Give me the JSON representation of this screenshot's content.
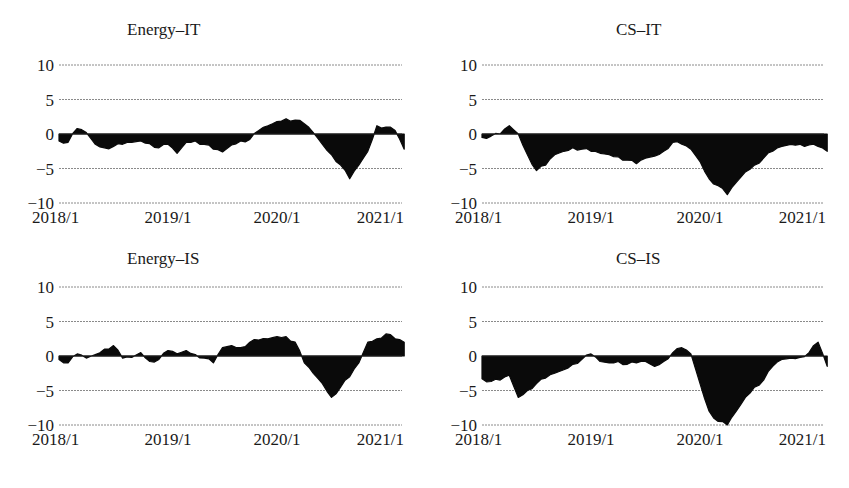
{
  "figure": {
    "y_ticks": [
      10,
      5,
      0,
      -5,
      -10
    ],
    "x_ticks": [
      "2018/1",
      "2019/1",
      "2020/1",
      "2021/1"
    ],
    "fill_color": "#0a0a0a",
    "grid_color": "#8a8a8a"
  },
  "chart_data": [
    {
      "type": "area",
      "title": "Energy–IT",
      "xlabel": "",
      "ylabel": "",
      "ylim": [
        -10,
        10
      ],
      "grid": true,
      "x_tick_labels": [
        "2018/1",
        "2019/1",
        "2020/1",
        "2021/1"
      ],
      "y_tick_labels": [
        "10",
        "5",
        "0",
        "−5",
        "−10"
      ],
      "x_start": "2018/1",
      "x_end": "2021/3",
      "frequency": "monthly",
      "values": [
        -1.0,
        -1.2,
        0.8,
        0.2,
        -1.5,
        -2.0,
        -1.8,
        -1.5,
        -1.2,
        -1.0,
        -1.4,
        -2.0,
        -1.5,
        -2.8,
        -1.2,
        -1.0,
        -1.5,
        -2.2,
        -2.6,
        -1.6,
        -1.0,
        -0.8,
        0.5,
        1.2,
        1.8,
        2.2,
        2.0,
        1.5,
        0.2,
        -1.5,
        -3.0,
        -4.5,
        -6.5,
        -4.5,
        -2.5,
        1.2,
        1.0,
        0.5,
        -2.2
      ]
    },
    {
      "type": "area",
      "title": "CS–IT",
      "xlabel": "",
      "ylabel": "",
      "ylim": [
        -10,
        10
      ],
      "grid": true,
      "x_tick_labels": [
        "2018/1",
        "2019/1",
        "2020/1",
        "2021/1"
      ],
      "y_tick_labels": [
        "10",
        "5",
        "0",
        "−5",
        "−10"
      ],
      "x_start": "2018/1",
      "x_end": "2021/3",
      "frequency": "monthly",
      "values": [
        -0.5,
        -0.3,
        0.0,
        1.2,
        0.0,
        -3.0,
        -5.3,
        -4.5,
        -3.0,
        -2.5,
        -2.0,
        -2.2,
        -2.5,
        -2.8,
        -3.0,
        -3.3,
        -3.8,
        -4.3,
        -3.5,
        -3.2,
        -2.5,
        -1.2,
        -1.5,
        -2.2,
        -4.0,
        -6.5,
        -7.5,
        -8.8,
        -7.0,
        -5.5,
        -4.5,
        -3.5,
        -2.5,
        -1.8,
        -1.5,
        -1.5,
        -1.6,
        -1.8,
        -2.5
      ]
    },
    {
      "type": "area",
      "title": "Energy–IS",
      "xlabel": "",
      "ylabel": "",
      "ylim": [
        -10,
        10
      ],
      "grid": true,
      "x_tick_labels": [
        "2018/1",
        "2019/1",
        "2020/1",
        "2021/1"
      ],
      "y_tick_labels": [
        "10",
        "5",
        "0",
        "−5",
        "−10"
      ],
      "x_start": "2018/1",
      "x_end": "2021/3",
      "frequency": "monthly",
      "values": [
        -0.5,
        -1.0,
        0.3,
        -0.3,
        0.2,
        1.0,
        1.5,
        -0.3,
        -0.2,
        0.5,
        -0.8,
        -0.5,
        0.8,
        0.3,
        0.8,
        0.2,
        -0.3,
        -1.0,
        1.2,
        1.5,
        1.2,
        2.0,
        2.3,
        2.5,
        2.8,
        2.8,
        2.0,
        -1.0,
        -2.5,
        -4.0,
        -6.0,
        -4.5,
        -3.0,
        -1.0,
        2.0,
        2.5,
        3.2,
        2.5,
        2.0
      ]
    },
    {
      "type": "area",
      "title": "CS–IS",
      "xlabel": "",
      "ylabel": "",
      "ylim": [
        -10,
        10
      ],
      "grid": true,
      "x_tick_labels": [
        "2018/1",
        "2019/1",
        "2020/1",
        "2021/1"
      ],
      "y_tick_labels": [
        "10",
        "5",
        "0",
        "−5",
        "−10"
      ],
      "x_start": "2018/1",
      "x_end": "2021/3",
      "frequency": "monthly",
      "values": [
        -3.3,
        -3.7,
        -3.5,
        -2.8,
        -6.0,
        -5.0,
        -4.0,
        -3.2,
        -2.5,
        -2.0,
        -1.2,
        -0.5,
        0.3,
        -0.8,
        -1.0,
        -0.8,
        -1.2,
        -1.0,
        -0.8,
        -1.5,
        -0.8,
        0.5,
        1.2,
        0.3,
        -4.0,
        -8.0,
        -9.5,
        -10.0,
        -8.0,
        -6.0,
        -4.5,
        -3.5,
        -1.5,
        -0.5,
        -0.3,
        -0.2,
        0.5,
        2.0,
        -1.5
      ]
    }
  ]
}
